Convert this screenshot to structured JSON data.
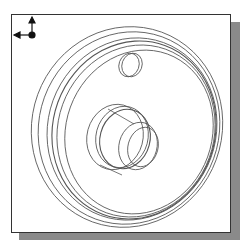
{
  "viewport": {
    "view": "isometric wireframe",
    "model": "wheel / pulley with offset bore",
    "line_color": "#555555",
    "background": "#ffffff",
    "frame_color": "#333333",
    "shadow_color": "#8a8a8a"
  },
  "triad": {
    "icon": "axis-triad-icon",
    "axes": [
      "up",
      "left",
      "origin"
    ]
  }
}
